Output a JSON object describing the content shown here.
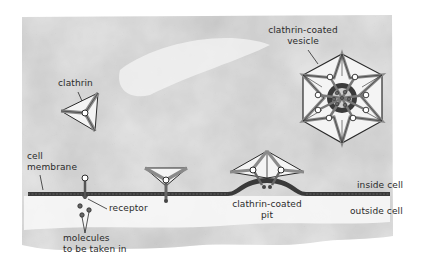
{
  "figure": {
    "type": "diagram",
    "topic": "receptor-mediated endocytosis via clathrin-coated pits",
    "colors": {
      "background": "#ffffff",
      "paper": "#d9d9d9",
      "paper_light": "#eeeeee",
      "membrane": "#3a3a3a",
      "ink": "#2a2a2a",
      "clathrin_fill": "#8a8a8a",
      "clathrin_face": "#f4f4f4"
    }
  },
  "labels": {
    "clathrin": "clathrin",
    "vesicle_line1": "clathrin-coated",
    "vesicle_line2": "vesicle",
    "cell_membrane_line1": "cell",
    "cell_membrane_line2": "membrane",
    "receptor": "receptor",
    "molecules_line1": "molecules",
    "molecules_line2": "to be taken in",
    "pit_line1": "clathrin-coated",
    "pit_line2": "pit",
    "inside_cell": "inside cell",
    "outside_cell": "outside cell"
  },
  "elements": [
    {
      "name": "clathrin-triskelion",
      "description": "free clathrin triskelion above membrane"
    },
    {
      "name": "clathrin-bound-receptor",
      "description": "clathrin triangle attaching to receptor on membrane"
    },
    {
      "name": "clathrin-coated-pit",
      "description": "membrane invaginating with clathrin coat and receptors"
    },
    {
      "name": "clathrin-coated-vesicle",
      "description": "hexagonal clathrin cage around vesicle with receptors and molecules"
    },
    {
      "name": "free-receptor",
      "description": "receptor spanning membrane"
    },
    {
      "name": "molecules",
      "description": "three small molecules outside cell"
    }
  ]
}
